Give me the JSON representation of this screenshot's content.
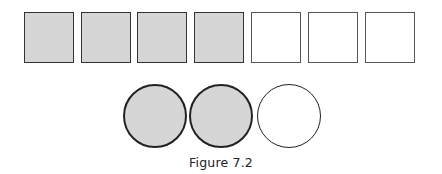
{
  "figure": {
    "caption": "Figure 7.2",
    "squares": {
      "total": 7,
      "shaded": 4,
      "items": [
        {
          "shaded": true
        },
        {
          "shaded": true
        },
        {
          "shaded": true
        },
        {
          "shaded": true
        },
        {
          "shaded": false
        },
        {
          "shaded": false
        },
        {
          "shaded": false
        }
      ]
    },
    "circles": {
      "total": 3,
      "shaded": 2,
      "items": [
        {
          "shaded": true
        },
        {
          "shaded": true
        },
        {
          "shaded": false
        }
      ]
    },
    "colors": {
      "shade": "#d6d6d6",
      "outline": "#333333",
      "background": "#ffffff"
    }
  }
}
